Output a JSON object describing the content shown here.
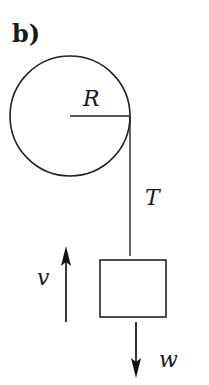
{
  "figure": {
    "panel_label": "b)",
    "labels": {
      "radius": "R",
      "tension": "T",
      "velocity": "v",
      "weight": "w"
    }
  },
  "colors": {
    "ink": "#222222",
    "background": "#ffffff"
  }
}
